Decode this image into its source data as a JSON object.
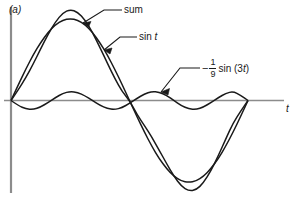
{
  "figure": {
    "panel_label": "(a)",
    "axis_label_t": "t",
    "background_color": "#ffffff",
    "curve_color": "#1a1a1a",
    "axis_color": "#8c8c8c",
    "leader_color": "#1a1a1a"
  },
  "annotations": {
    "sum": "sum",
    "fundamental": "sin t",
    "fundamental_fn": "sin",
    "fundamental_var": "t",
    "harmonic_sign": "−",
    "harmonic_numerator": "1",
    "harmonic_denominator": "9",
    "harmonic_fn": "sin (3",
    "harmonic_var": "t",
    "harmonic_close": ")"
  },
  "chart_data": {
    "type": "line",
    "title": "(a)",
    "xlabel": "t",
    "ylabel": "",
    "grid": false,
    "legend": "inline-annotations",
    "xlim": [
      0,
      6.283185
    ],
    "ylim": [
      -1.12,
      1.12
    ],
    "x_tick_labels": [],
    "y_tick_labels": [],
    "x": [
      0,
      0.1963,
      0.3927,
      0.589,
      0.7854,
      0.9817,
      1.1781,
      1.3744,
      1.5708,
      1.7671,
      1.9635,
      2.1598,
      2.3562,
      2.5525,
      2.7489,
      2.9452,
      3.1416,
      3.3379,
      3.5343,
      3.7306,
      3.927,
      4.1233,
      4.3197,
      4.516,
      4.7124,
      4.9087,
      5.1051,
      5.3014,
      5.4978,
      5.6941,
      5.8905,
      6.0868,
      6.2832
    ],
    "series": [
      {
        "name": "sin t",
        "label": "sin t",
        "expression": "sin(t)",
        "values": [
          0,
          0.195,
          0.383,
          0.556,
          0.707,
          0.831,
          0.924,
          0.981,
          1.0,
          0.981,
          0.924,
          0.831,
          0.707,
          0.556,
          0.383,
          0.195,
          0,
          -0.195,
          -0.383,
          -0.556,
          -0.707,
          -0.831,
          -0.924,
          -0.981,
          -1.0,
          -0.981,
          -0.924,
          -0.831,
          -0.707,
          -0.556,
          -0.383,
          -0.195,
          0
        ]
      },
      {
        "name": "minus one ninth sin 3t",
        "label": "-1/9 sin (3t)",
        "expression": "-(1/9)*sin(3t)",
        "amplitude": 0.1111,
        "values": [
          0,
          -0.063,
          -0.103,
          -0.111,
          -0.079,
          -0.025,
          0.035,
          0.087,
          0.111,
          0.099,
          0.058,
          0.0,
          -0.058,
          -0.099,
          -0.111,
          -0.087,
          -0.035,
          0.025,
          0.079,
          0.111,
          0.103,
          0.063,
          0.0,
          -0.063,
          -0.103,
          -0.111,
          -0.079,
          -0.025,
          0.035,
          0.087,
          0.111,
          0.063,
          0
        ]
      },
      {
        "name": "sum",
        "label": "sum",
        "expression": "sin(t) - (1/9)sin(3t)",
        "values": [
          0,
          0.132,
          0.28,
          0.445,
          0.628,
          0.806,
          0.959,
          1.068,
          1.111,
          1.08,
          0.982,
          0.831,
          0.649,
          0.457,
          0.272,
          0.108,
          0,
          -0.17,
          -0.304,
          -0.445,
          -0.604,
          -0.768,
          -0.924,
          -1.044,
          -1.103,
          -1.092,
          -1.003,
          -0.856,
          -0.672,
          -0.469,
          -0.272,
          -0.132,
          0
        ]
      }
    ]
  }
}
